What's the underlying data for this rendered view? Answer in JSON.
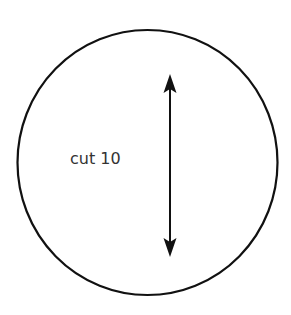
{
  "diagram": {
    "shape": "circle",
    "label": "cut 10",
    "arrow": {
      "direction": "vertical",
      "ends": "double-headed"
    },
    "colors": {
      "stroke": "#111111",
      "text": "#333333",
      "background": "#ffffff"
    }
  }
}
